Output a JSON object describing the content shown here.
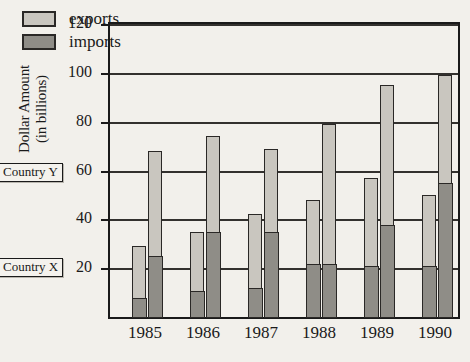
{
  "chart_data": {
    "type": "bar",
    "subtype": "grouped-stacked",
    "title": "",
    "xlabel": "",
    "ylabel": "Dollar Amount (in billions)",
    "ylim": [
      0,
      120
    ],
    "yticks": [
      0,
      20,
      40,
      60,
      80,
      100,
      120
    ],
    "ytick_labels": [
      "",
      "20",
      "40",
      "60",
      "80",
      "100",
      "120"
    ],
    "grid": true,
    "grid_axis": "y",
    "legend_position": "top-left",
    "categories": [
      "1985",
      "1986",
      "1987",
      "1988",
      "1989",
      "1990"
    ],
    "group_labels": [
      "Country X",
      "Country Y"
    ],
    "stack_order": [
      "imports",
      "exports"
    ],
    "series": [
      {
        "name": "Country X imports",
        "country": "Country X",
        "component": "imports",
        "values": [
          8,
          11,
          12,
          22,
          21,
          21
        ]
      },
      {
        "name": "Country X exports",
        "country": "Country X",
        "component": "exports",
        "values": [
          21,
          24,
          30,
          26,
          36,
          29
        ]
      },
      {
        "name": "Country Y imports",
        "country": "Country Y",
        "component": "imports",
        "values": [
          25,
          35,
          35,
          22,
          38,
          55
        ]
      },
      {
        "name": "Country Y exports",
        "country": "Country Y",
        "component": "exports",
        "values": [
          43,
          39,
          34,
          57,
          57,
          44
        ]
      }
    ],
    "totals": {
      "Country X": [
        29,
        35,
        42,
        48,
        57,
        50
      ],
      "Country Y": [
        68,
        74,
        69,
        79,
        95,
        99
      ]
    },
    "colors": {
      "exports": "#c9c6bf",
      "imports": "#8f8d87",
      "outline": "#2a2826",
      "background": "#f2f0eb",
      "grid": "#33312e"
    }
  },
  "axis": {
    "y_title_line1": "Dollar Amount",
    "y_title_line2": "(in billions)"
  },
  "legend": {
    "exports_label": "exports",
    "imports_label": "imports"
  },
  "callouts": {
    "country_y": "Country Y",
    "country_x": "Country X"
  }
}
